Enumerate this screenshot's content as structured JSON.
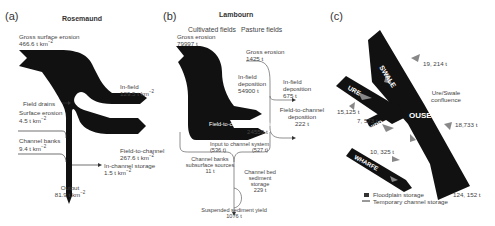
{
  "panel_a": {
    "label": "(a)",
    "title": "Rosemaund",
    "gross_surface_erosion": {
      "label": "Gross surface erosion",
      "value": "466.6 t km",
      "unit_sup": "−2"
    },
    "in_field": {
      "label": "In-field",
      "value": "129.5 t km",
      "unit_sup": "−2"
    },
    "field_drains": {
      "label": "Field drains"
    },
    "surface_erosion": {
      "label": "Surface erosion",
      "value": "4.5 t km",
      "unit_sup": "−2"
    },
    "channel_banks": {
      "label": "Channel banks",
      "value": "9.4 t km",
      "unit_sup": "−2"
    },
    "field_to_channel": {
      "label": "Field-to-channel",
      "value": "267.6 t km",
      "unit_sup": "−2"
    },
    "in_channel_storage": {
      "label": "In-channel storage",
      "value": "1.5 t km",
      "unit_sup": "−2"
    },
    "output": {
      "label": "Output",
      "value": "81.9 t km",
      "unit_sup": "−2"
    }
  },
  "panel_b": {
    "label": "(b)",
    "title": "Lambourn",
    "col_cultivated": "Cultivated fields",
    "col_pasture": "Pasture fields",
    "gross_erosion_cult": {
      "label": "Gross erosion",
      "value": "79997 t"
    },
    "gross_erosion_past": {
      "label": "Gross erosion",
      "value": "1425 t"
    },
    "in_field_dep_cult": {
      "label1": "In-field",
      "label2": "deposition",
      "value": "54900 t"
    },
    "in_field_dep_past": {
      "label1": "In-field",
      "label2": "deposition",
      "value": "675 t"
    },
    "field_to_channel_past": {
      "label1": "Field-to-channel",
      "label2": "deposition",
      "value": "222 t"
    },
    "field_to_channel_cult": {
      "label": "Field-to-channel deposition",
      "value": "24559 t"
    },
    "input_channel": {
      "label": "Input to channel system",
      "left": "(536 t)",
      "right": "(527 t)"
    },
    "channel_banks": {
      "label1": "Channel banks",
      "label2": "subsurface sources",
      "value": "11 t"
    },
    "channel_bed": {
      "label1": "Channel bed",
      "label2": "sediment",
      "label3": "storage",
      "value": "229 t"
    },
    "suspended_yield": {
      "label": "Suspended sediment yield",
      "value": "1076 t"
    }
  },
  "panel_c": {
    "label": "(c)",
    "rivers": [
      "SWALE",
      "URE",
      "NIDD",
      "OUSE",
      "WHARFE"
    ],
    "swale_value": "19, 214 t",
    "confluence": {
      "line1": "Ure/Swale",
      "line2": "confluence"
    },
    "ure_value": "15,125 t",
    "nidd_value": "7, 573 t",
    "ouse_value": "18,733 t",
    "wharfe_value": "10, 325 t",
    "outlet_value": "124, 152 t",
    "legend": [
      {
        "label": "Floodplain storage",
        "icon": "floodplain-storage-symbol"
      },
      {
        "label": "Temporary channel storage",
        "icon": "channel-storage-symbol"
      }
    ]
  },
  "colors": {
    "flow": "#111111",
    "storage": "#888888",
    "text": "#444444"
  }
}
